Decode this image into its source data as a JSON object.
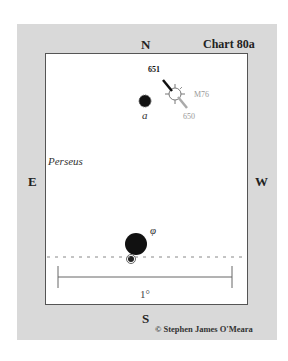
{
  "chart": {
    "title": "Chart 80a",
    "copyright": "© Stephen James O'Meara",
    "directions": {
      "north": "N",
      "south": "S",
      "east": "E",
      "west": "W"
    },
    "constellation": "Perseus",
    "scale": {
      "label": "1°"
    }
  },
  "objects": {
    "m76": {
      "label": "M76",
      "type": "planetary-nebula"
    },
    "ngc651": {
      "label": "651"
    },
    "ngc650": {
      "label": "650"
    },
    "alpha_star": {
      "label": "a"
    },
    "phi_star": {
      "label": "φ"
    }
  },
  "colors": {
    "frame": "#d9d9d9",
    "panel": "#ffffff",
    "border": "#555555",
    "star": "#111111",
    "faint": "#999999"
  }
}
